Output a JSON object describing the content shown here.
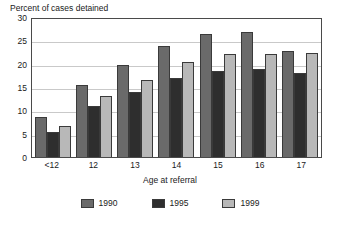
{
  "chart_data": {
    "type": "bar",
    "title": "Percent of cases detained",
    "xlabel": "Age at referral",
    "ylabel": "",
    "categories": [
      "<12",
      "12",
      "13",
      "14",
      "15",
      "16",
      "17"
    ],
    "series": [
      {
        "name": "1990",
        "color": "#6a6a6a",
        "values": [
          8.5,
          15.5,
          19.8,
          23.8,
          26.3,
          26.7,
          22.7
        ]
      },
      {
        "name": "1995",
        "color": "#2e2e2e",
        "values": [
          5.3,
          11.0,
          14.0,
          17.0,
          18.5,
          18.9,
          18.0
        ]
      },
      {
        "name": "1999",
        "color": "#b8b8b8",
        "values": [
          6.7,
          13.0,
          16.5,
          20.4,
          22.0,
          22.1,
          22.3
        ]
      }
    ],
    "ylim": [
      0,
      30
    ],
    "yticks": [
      0,
      5,
      10,
      15,
      20,
      25,
      30
    ],
    "ytick_labels": [
      "0",
      "5",
      "10",
      "15",
      "20",
      "25",
      "30"
    ],
    "grid": true,
    "legend_position": "bottom"
  }
}
